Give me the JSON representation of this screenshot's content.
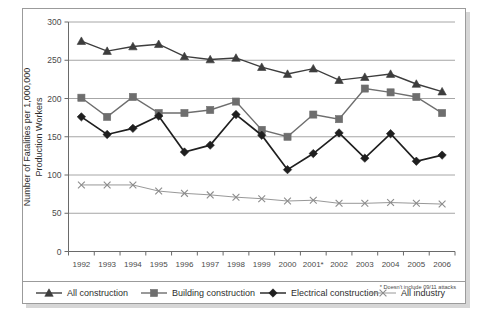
{
  "chart_data": {
    "type": "line",
    "title": "",
    "xlabel": "",
    "ylabel": "Number of Fatalities per 1,000,000 Production Workers",
    "ylim": [
      0,
      300
    ],
    "yticks": [
      0,
      50,
      100,
      150,
      200,
      250,
      300
    ],
    "grid": true,
    "legend_position": "bottom",
    "categories": [
      "1992",
      "1993",
      "1994",
      "1995",
      "1996",
      "1997",
      "1998",
      "1999",
      "2000",
      "2001*",
      "2002",
      "2003",
      "2004",
      "2005",
      "2006"
    ],
    "annotations": [
      "* Doesn't include 09/11 attacks"
    ],
    "series": [
      {
        "name": "All construction",
        "marker": "triangle",
        "color": "#3d3d3d",
        "values": [
          275,
          262,
          268,
          271,
          255,
          251,
          253,
          241,
          232,
          239,
          224,
          228,
          232,
          219,
          209
        ]
      },
      {
        "name": "Building construction",
        "marker": "square",
        "color": "#6e6e6e",
        "values": [
          201,
          176,
          202,
          181,
          181,
          185,
          196,
          159,
          150,
          179,
          173,
          213,
          208,
          202,
          181
        ]
      },
      {
        "name": "Electrical construction",
        "marker": "diamond",
        "color": "#1f1f1f",
        "values": [
          176,
          153,
          161,
          177,
          130,
          139,
          179,
          152,
          107,
          128,
          155,
          122,
          154,
          118,
          126
        ]
      },
      {
        "name": "All industry",
        "marker": "x",
        "color": "#8c8c8c",
        "values": [
          87,
          87,
          87,
          79,
          76,
          74,
          71,
          69,
          66,
          67,
          63,
          63,
          64,
          63,
          62
        ]
      }
    ]
  },
  "axis": {
    "y_title_line1": "Number of Fatalities per 1,000,000",
    "y_title_line2": "Production Workers"
  },
  "legend": {
    "items": [
      {
        "label": "All construction",
        "marker": "triangle-marker"
      },
      {
        "label": "Building construction",
        "marker": "square-marker"
      },
      {
        "label": "Electrical construction",
        "marker": "diamond-marker"
      },
      {
        "label": "All industry",
        "marker": "x-marker"
      }
    ]
  },
  "footnote": {
    "text": "* Doesn't include 09/11 attacks"
  },
  "colors": {
    "all_construction": "#3d3d3d",
    "building_construction": "#6e6e6e",
    "electrical_construction": "#1f1f1f",
    "all_industry": "#8c8c8c",
    "grid": "#8f8f8f",
    "frame": "#9b9b9b"
  }
}
